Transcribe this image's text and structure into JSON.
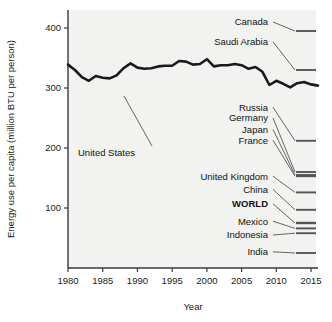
{
  "chart_data": {
    "type": "line",
    "title": "",
    "xlabel": "Year",
    "ylabel": "Energy use per capita (million BTU per person)",
    "xlim": [
      1980,
      2016
    ],
    "ylim": [
      0,
      430
    ],
    "xticks": [
      1980,
      1985,
      1990,
      1995,
      2000,
      2005,
      2010,
      2015
    ],
    "xticklabels": [
      "1980",
      "1985",
      "1990",
      "1995",
      "2000",
      "2005",
      "2010",
      "2015"
    ],
    "yticks": [
      100,
      200,
      300,
      400
    ],
    "yticklabels": [
      "100",
      "200",
      "300",
      "400"
    ],
    "grid": false,
    "legend_position": "inline-right-labels",
    "annotations": [
      {
        "text": "United States",
        "target_year": 1991,
        "target_value": 333
      }
    ],
    "series": [
      {
        "name": "United States",
        "emphasis": "bold",
        "color": "#1a1a1a",
        "x": [
          1980,
          1981,
          1982,
          1983,
          1984,
          1985,
          1986,
          1987,
          1988,
          1989,
          1990,
          1991,
          1992,
          1993,
          1994,
          1995,
          1996,
          1997,
          1998,
          1999,
          2000,
          2001,
          2002,
          2003,
          2004,
          2005,
          2006,
          2007,
          2008,
          2009,
          2010,
          2011,
          2012,
          2013,
          2014,
          2015,
          2016
        ],
        "y": [
          339,
          330,
          318,
          312,
          320,
          317,
          316,
          321,
          333,
          341,
          334,
          332,
          333,
          336,
          337,
          337,
          345,
          344,
          339,
          340,
          348,
          336,
          338,
          338,
          340,
          338,
          332,
          335,
          327,
          305,
          312,
          307,
          301,
          308,
          310,
          306,
          304
        ]
      },
      {
        "name": "Canada",
        "endpoint_value": 395,
        "label_value": 410,
        "color": "#555555"
      },
      {
        "name": "Saudi Arabia",
        "endpoint_value": 330,
        "label_value": 377,
        "color": "#555555"
      },
      {
        "name": "Russia",
        "endpoint_value": 212,
        "label_value": 268,
        "color": "#555555"
      },
      {
        "name": "Germany",
        "endpoint_value": 160,
        "label_value": 250,
        "color": "#555555"
      },
      {
        "name": "Japan",
        "endpoint_value": 155,
        "label_value": 231,
        "color": "#555555"
      },
      {
        "name": "France",
        "endpoint_value": 153,
        "label_value": 213,
        "color": "#555555"
      },
      {
        "name": "United Kingdom",
        "endpoint_value": 126,
        "label_value": 153,
        "color": "#555555"
      },
      {
        "name": "China",
        "endpoint_value": 97,
        "label_value": 131,
        "color": "#555555"
      },
      {
        "name": "WORLD",
        "emphasis": "bold",
        "endpoint_value": 75,
        "label_value": 107,
        "color": "#555555"
      },
      {
        "name": "Mexico",
        "endpoint_value": 66,
        "label_value": 78,
        "color": "#555555"
      },
      {
        "name": "Indonesia",
        "endpoint_value": 58,
        "label_value": 55,
        "color": "#555555"
      },
      {
        "name": "India",
        "endpoint_value": 25,
        "label_value": 27,
        "color": "#555555"
      }
    ]
  },
  "axes": {
    "ylabel": "Energy use per capita (million BTU per person)",
    "xlabel": "Year",
    "ytick_labels": [
      "400",
      "300",
      "200",
      "100"
    ],
    "xtick_labels": [
      "1980",
      "1985",
      "1990",
      "1995",
      "2000",
      "2005",
      "2010",
      "2015"
    ]
  },
  "series_labels": {
    "canada": "Canada",
    "saudi_arabia": "Saudi Arabia",
    "united_states": "United States",
    "russia": "Russia",
    "germany": "Germany",
    "japan": "Japan",
    "france": "France",
    "united_kingdom": "United Kingdom",
    "china": "China",
    "world": "WORLD",
    "mexico": "Mexico",
    "indonesia": "Indonesia",
    "india": "India"
  },
  "colors": {
    "plot_background": "#f2f2f0",
    "axis": "#3a3a3a",
    "emphasis_line": "#1a1a1a",
    "other_line": "#555555",
    "text": "#111111"
  }
}
